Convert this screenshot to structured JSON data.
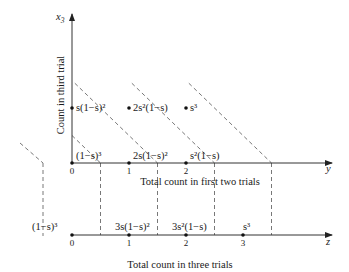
{
  "diagram": {
    "top_axes": {
      "vertical_axis_name": "x",
      "vertical_axis_sub": "3",
      "vertical_axis_title": "Count in third trial",
      "horizontal_axis_name": "y",
      "horizontal_axis_title": "Total count in first two trials",
      "ticks": [
        "0",
        "1",
        "2"
      ]
    },
    "bottom_axis": {
      "axis_name": "z",
      "axis_title": "Total count in three trials",
      "ticks": [
        "0",
        "1",
        "2",
        "3"
      ]
    },
    "points_third_trial_1": [
      {
        "y": 0,
        "x3": 1,
        "label": "s(1−s)²"
      },
      {
        "y": 1,
        "x3": 1,
        "label": "2s²(1−s)"
      },
      {
        "y": 2,
        "x3": 1,
        "label": "s³"
      }
    ],
    "points_third_trial_0": [
      {
        "y": 0,
        "x3": 0,
        "label": "(1−s)³"
      },
      {
        "y": 1,
        "x3": 0,
        "label": "2s(1−s)²"
      },
      {
        "y": 2,
        "x3": 0,
        "label": "s²(1−s)"
      }
    ],
    "z_points": [
      {
        "z": 0,
        "label": "(1−s)³"
      },
      {
        "z": 1,
        "label": "3s(1−s)²"
      },
      {
        "z": 2,
        "label": "3s²(1−s)"
      },
      {
        "z": 3,
        "label": "s³"
      }
    ],
    "projection_lines_sum": [
      0.5,
      1.5,
      2.5,
      3.5
    ]
  }
}
